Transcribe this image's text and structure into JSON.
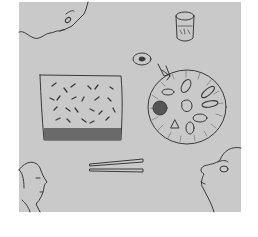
{
  "image": {
    "description": "Pencil sketch of a dining table seen from above with people's faces at the corners",
    "colors": {
      "paper": "#c9c9c9",
      "line": "#3a3a3a",
      "shade": "#6a6a6a",
      "border": "#ffffff"
    },
    "elements": [
      {
        "name": "face-top-left",
        "label": "Face in profile (top left)"
      },
      {
        "name": "glass",
        "label": "Drinking glass"
      },
      {
        "name": "small-dish",
        "label": "Small dish with sauce"
      },
      {
        "name": "rice-tray",
        "label": "Rectangular tray with rice / noodles"
      },
      {
        "name": "round-platter",
        "label": "Round platter with assorted food"
      },
      {
        "name": "chopsticks",
        "label": "Pair of chopsticks"
      },
      {
        "name": "face-bottom-left",
        "label": "Face in profile (bottom left)"
      },
      {
        "name": "face-bottom-right",
        "label": "Face in profile (bottom right)"
      }
    ]
  }
}
